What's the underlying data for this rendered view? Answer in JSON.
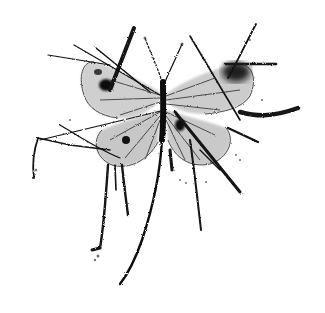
{
  "image": {
    "subject": "ink splatter butterfly illustration",
    "background": "#ffffff",
    "ink_color": "#111111",
    "wing_wash": "#9a9a9a",
    "caption": ""
  }
}
